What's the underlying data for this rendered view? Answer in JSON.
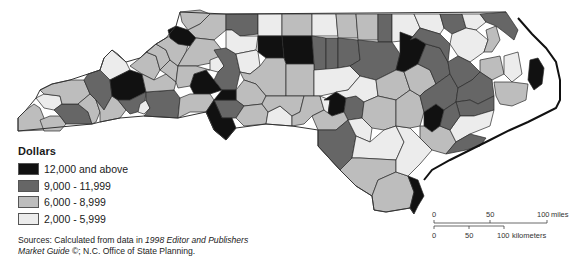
{
  "legend": {
    "title": "Dollars",
    "classes": [
      {
        "label": "12,000 and above",
        "color": "#111111"
      },
      {
        "label": "9,000 - 11,999",
        "color": "#666666"
      },
      {
        "label": "6,000 - 8,999",
        "color": "#bdbdbd"
      },
      {
        "label": "2,000 - 5,999",
        "color": "#ececec"
      }
    ]
  },
  "sources": {
    "prefix": "Sources: Calculated from data in ",
    "italic1": "1998 Editor and Publishers",
    "italic2": "Market Guide",
    "suffix": " ©; N.C. Office of State Planning."
  },
  "scale_bar": {
    "miles": {
      "ticks": [
        "0",
        "50",
        "100"
      ],
      "unit": "miles"
    },
    "kilometers": {
      "ticks": [
        "0",
        "50",
        "100"
      ],
      "unit": "kilometers"
    }
  }
}
